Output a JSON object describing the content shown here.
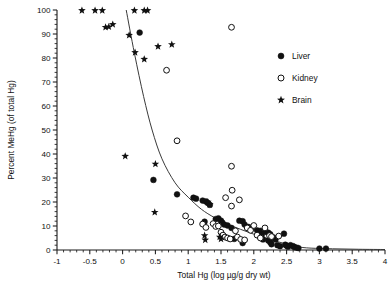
{
  "chart_data": {
    "type": "scatter",
    "title": "",
    "xlabel": "Total Hg (log µg/g dry wt)",
    "ylabel": "Percent MeHg (of total Hg)",
    "xlim": [
      -1,
      4
    ],
    "ylim": [
      0,
      100
    ],
    "xticks": [
      -1,
      -0.5,
      0,
      0.5,
      1,
      1.5,
      2,
      2.5,
      3,
      3.5,
      4
    ],
    "xticklabels": [
      "-1",
      "-0.5",
      "0",
      "0.5",
      "1",
      "1.5",
      "2",
      "2.5",
      "3",
      "3.5",
      "4"
    ],
    "yticks": [
      0,
      10,
      20,
      30,
      40,
      50,
      60,
      70,
      80,
      90,
      100
    ],
    "yticklabels": [
      "0",
      "10",
      "20",
      "30",
      "40",
      "50",
      "60",
      "70",
      "80",
      "90",
      "100"
    ],
    "grid": false,
    "minor_ticks": true,
    "legend_position": "upper-right",
    "legend": [
      {
        "label": "Liver",
        "marker": "filled-circle",
        "color": "#111111"
      },
      {
        "label": "Kidney",
        "marker": "open-circle",
        "color": "#111111"
      },
      {
        "label": "Brain",
        "marker": "star",
        "color": "#111111"
      }
    ],
    "series": [
      {
        "name": "Liver",
        "marker": "filled-circle",
        "color": "#111111",
        "points": [
          [
            0.26,
            90.6
          ],
          [
            0.47,
            29.2
          ],
          [
            0.83,
            23.2
          ],
          [
            1.08,
            21.8
          ],
          [
            1.12,
            21.4
          ],
          [
            1.22,
            20.6
          ],
          [
            1.27,
            20.2
          ],
          [
            1.3,
            19.6
          ],
          [
            1.33,
            18.8
          ],
          [
            1.25,
            11.8
          ],
          [
            1.42,
            12.9
          ],
          [
            1.46,
            13.2
          ],
          [
            1.5,
            12.2
          ],
          [
            1.52,
            11.4
          ],
          [
            1.55,
            10.6
          ],
          [
            1.6,
            10.2
          ],
          [
            1.66,
            9.2
          ],
          [
            1.7,
            4.6
          ],
          [
            1.78,
            12.2
          ],
          [
            1.83,
            12.0
          ],
          [
            1.86,
            10.6
          ],
          [
            1.92,
            9.6
          ],
          [
            1.97,
            9.0
          ],
          [
            1.83,
            2.9
          ],
          [
            2.05,
            8.2
          ],
          [
            2.1,
            8.0
          ],
          [
            2.12,
            6.2
          ],
          [
            2.14,
            4.4
          ],
          [
            2.18,
            7.6
          ],
          [
            2.22,
            7.2
          ],
          [
            2.25,
            6.6
          ],
          [
            2.22,
            4.0
          ],
          [
            2.25,
            3.2
          ],
          [
            2.27,
            2.4
          ],
          [
            2.3,
            5.2
          ],
          [
            2.33,
            4.4
          ],
          [
            2.36,
            2.0
          ],
          [
            2.4,
            1.6
          ],
          [
            2.46,
            6.8
          ],
          [
            2.48,
            2.2
          ],
          [
            2.5,
            1.8
          ],
          [
            2.52,
            1.4
          ],
          [
            2.56,
            2.0
          ],
          [
            2.6,
            1.6
          ],
          [
            2.62,
            1.2
          ],
          [
            2.65,
            1.0
          ],
          [
            2.68,
            0.8
          ],
          [
            3.0,
            0.6
          ],
          [
            3.1,
            0.6
          ]
        ]
      },
      {
        "name": "Kidney",
        "marker": "open-circle",
        "color": "#111111",
        "points": [
          [
            1.66,
            92.8
          ],
          [
            0.67,
            74.9
          ],
          [
            0.83,
            45.5
          ],
          [
            1.66,
            34.9
          ],
          [
            1.67,
            24.9
          ],
          [
            1.78,
            20.9
          ],
          [
            1.66,
            18.3
          ],
          [
            1.57,
            21.8
          ],
          [
            0.96,
            14.2
          ],
          [
            1.04,
            11.7
          ],
          [
            1.22,
            10.8
          ],
          [
            1.27,
            9.4
          ],
          [
            1.38,
            11.0
          ],
          [
            1.42,
            9.8
          ],
          [
            1.46,
            10.0
          ],
          [
            1.5,
            7.4
          ],
          [
            1.53,
            6.2
          ],
          [
            1.56,
            5.4
          ],
          [
            1.6,
            5.0
          ],
          [
            1.64,
            4.6
          ],
          [
            1.72,
            8.0
          ],
          [
            1.75,
            5.4
          ],
          [
            1.8,
            4.4
          ],
          [
            1.86,
            4.2
          ],
          [
            1.9,
            9.2
          ],
          [
            1.95,
            8.2
          ],
          [
            2.0,
            10.2
          ],
          [
            2.05,
            6.2
          ],
          [
            2.1,
            5.0
          ],
          [
            2.17,
            9.2
          ],
          [
            2.24,
            6.0
          ],
          [
            2.27,
            5.6
          ],
          [
            2.38,
            5.8
          ]
        ]
      },
      {
        "name": "Brain",
        "marker": "star",
        "color": "#111111",
        "points": [
          [
            -0.62,
            99.8
          ],
          [
            -0.42,
            99.8
          ],
          [
            -0.31,
            99.8
          ],
          [
            0.18,
            99.8
          ],
          [
            0.33,
            99.8
          ],
          [
            0.38,
            99.8
          ],
          [
            -0.26,
            92.8
          ],
          [
            -0.21,
            93.0
          ],
          [
            -0.15,
            94.0
          ],
          [
            0.1,
            89.5
          ],
          [
            0.19,
            82.3
          ],
          [
            0.33,
            79.5
          ],
          [
            0.54,
            84.8
          ],
          [
            0.75,
            85.6
          ],
          [
            0.04,
            39.1
          ],
          [
            0.5,
            35.8
          ],
          [
            0.49,
            15.7
          ],
          [
            1.25,
            6.0
          ],
          [
            1.26,
            4.2
          ],
          [
            1.3,
            20.0
          ],
          [
            1.33,
            19.0
          ],
          [
            1.48,
            5.4
          ],
          [
            1.5,
            4.6
          ]
        ]
      }
    ],
    "fit_curve": {
      "description": "decaying power/exponential fit",
      "anchor_points": [
        [
          0.055,
          100
        ],
        [
          0.18,
          82
        ],
        [
          0.32,
          64
        ],
        [
          0.45,
          50
        ],
        [
          0.6,
          38
        ],
        [
          0.8,
          28
        ],
        [
          1.0,
          22
        ],
        [
          1.2,
          17
        ],
        [
          1.4,
          13.5
        ],
        [
          1.6,
          10.8
        ],
        [
          1.8,
          8.6
        ],
        [
          2.0,
          6.6
        ],
        [
          2.2,
          4.8
        ],
        [
          2.4,
          3.2
        ],
        [
          2.6,
          1.8
        ],
        [
          2.8,
          0.9
        ],
        [
          3.2,
          0.5
        ],
        [
          3.6,
          0.3
        ],
        [
          4.0,
          0.2
        ]
      ]
    }
  }
}
